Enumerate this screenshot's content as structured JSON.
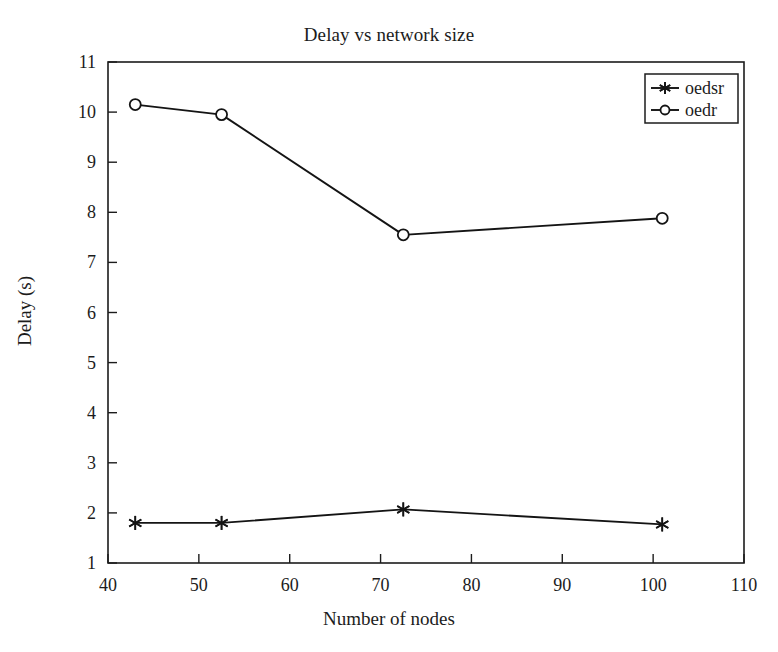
{
  "chart_data": {
    "type": "line",
    "title": "Delay vs network size",
    "xlabel": "Number of nodes",
    "ylabel": "Delay (s)",
    "xlim": [
      40,
      110
    ],
    "ylim": [
      1,
      11
    ],
    "xticks": [
      40,
      50,
      60,
      70,
      80,
      90,
      100,
      110
    ],
    "yticks": [
      1,
      2,
      3,
      4,
      5,
      6,
      7,
      8,
      9,
      10,
      11
    ],
    "grid": false,
    "legend_position": "top-right",
    "x": [
      43,
      52.5,
      72.5,
      101
    ],
    "series": [
      {
        "name": "oedsr",
        "marker": "star",
        "color": "#141414",
        "values": [
          1.8,
          1.8,
          2.07,
          1.77
        ]
      },
      {
        "name": "oedr",
        "marker": "circle",
        "color": "#141414",
        "values": [
          10.15,
          9.95,
          7.55,
          7.88
        ]
      }
    ]
  },
  "legend": {
    "entries": [
      {
        "label": "oedsr"
      },
      {
        "label": "oedr"
      }
    ]
  },
  "axis": {
    "y_tick_labels": [
      "11",
      "10",
      "9",
      "8",
      "7",
      "6",
      "5",
      "4",
      "3",
      "2",
      "1"
    ],
    "x_tick_labels": [
      "40",
      "50",
      "60",
      "70",
      "80",
      "90",
      "100",
      "110"
    ]
  }
}
